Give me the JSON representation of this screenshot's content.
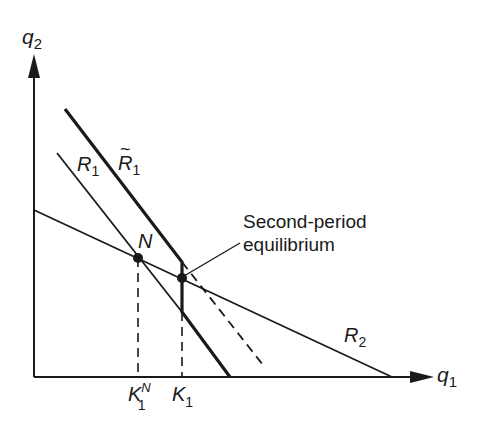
{
  "figure": {
    "axes": {
      "y_label": "q",
      "y_sub": "2",
      "x_label": "q",
      "x_sub": "1"
    },
    "curves": {
      "r1": {
        "label": "R",
        "sub": "1"
      },
      "r1_tilde": {
        "label": "R",
        "sub": "1",
        "accent": "~"
      },
      "r2": {
        "label": "R",
        "sub": "2"
      }
    },
    "points": {
      "nash": {
        "label": "N"
      },
      "second_period": {
        "label_line1": "Second-period",
        "label_line2": "equilibrium"
      }
    },
    "ticks": {
      "k1n": {
        "label": "K",
        "sub": "1",
        "sup": "N"
      },
      "k1": {
        "label": "K",
        "sub": "1"
      }
    },
    "colors": {
      "ink": "#1a1a1a",
      "background": "#ffffff"
    }
  }
}
